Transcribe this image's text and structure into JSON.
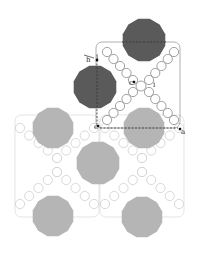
{
  "diagram": {
    "colors": {
      "dark_polygon": "#5a5a5a",
      "light_polygon": "#b5b5b5",
      "dark_frame": "#8c8c8c",
      "light_frame": "#d9d9d9",
      "small_circle_dark": "#8a8a8a",
      "small_circle_light": "#cfcfcf",
      "dashed_line": "#333333"
    },
    "labels": {
      "h": "h",
      "c": "c",
      "e": "e",
      "a": "a",
      "i1": "i",
      "i2": "i"
    }
  }
}
